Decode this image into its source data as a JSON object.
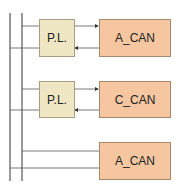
{
  "diagram": {
    "colors": {
      "pl_fill": "#efe6c4",
      "can_fill": "#f5c6a0",
      "line": "#333333"
    },
    "rows": [
      {
        "pl_label": "P.L.",
        "can_label": "A_CAN"
      },
      {
        "pl_label": "P.L.",
        "can_label": "C_CAN"
      },
      {
        "pl_label": null,
        "can_label": "A_CAN"
      }
    ]
  }
}
